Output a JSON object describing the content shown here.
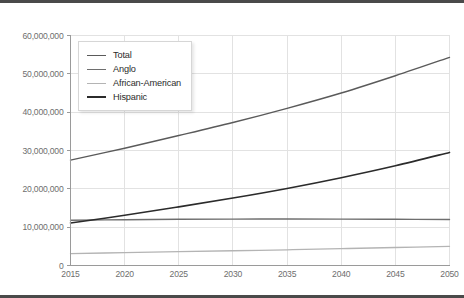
{
  "chart_data": {
    "type": "line",
    "title": "",
    "xlabel": "",
    "ylabel": "",
    "x": [
      2015,
      2020,
      2025,
      2030,
      2035,
      2040,
      2045,
      2050
    ],
    "xlim": [
      2015,
      2050
    ],
    "ylim": [
      0,
      60000000
    ],
    "grid": true,
    "legend_position": "upper left inside plot",
    "xtick_labels": [
      "2015",
      "2020",
      "2025",
      "2030",
      "2035",
      "2040",
      "2045",
      "2050"
    ],
    "ytick_labels": [
      "0",
      "10,000,000",
      "20,000,000",
      "30,000,000",
      "40,000,000",
      "50,000,000",
      "60,000,000"
    ],
    "ytick_values": [
      0,
      10000000,
      20000000,
      30000000,
      40000000,
      50000000,
      60000000
    ],
    "series": [
      {
        "name": "Total",
        "color": "#5a5a5a",
        "width": 1.4,
        "values": [
          27500000,
          30600000,
          33900000,
          37300000,
          41000000,
          45000000,
          49500000,
          54300000
        ]
      },
      {
        "name": "Anglo",
        "color": "#6e6e6e",
        "width": 1.4,
        "values": [
          11800000,
          11950000,
          12050000,
          12100000,
          12120000,
          12100000,
          12050000,
          12000000
        ]
      },
      {
        "name": "African-American",
        "color": "#b4b4b4",
        "width": 1.3,
        "values": [
          3100000,
          3350000,
          3600000,
          3850000,
          4100000,
          4400000,
          4700000,
          5000000
        ]
      },
      {
        "name": "Hispanic",
        "color": "#2b2b2b",
        "width": 1.6,
        "values": [
          11100000,
          13100000,
          15300000,
          17600000,
          20100000,
          22900000,
          26000000,
          29500000
        ]
      }
    ]
  },
  "legend": {
    "entries": [
      {
        "label": "Total"
      },
      {
        "label": "Anglo"
      },
      {
        "label": "African-American"
      },
      {
        "label": "Hispanic"
      }
    ]
  }
}
